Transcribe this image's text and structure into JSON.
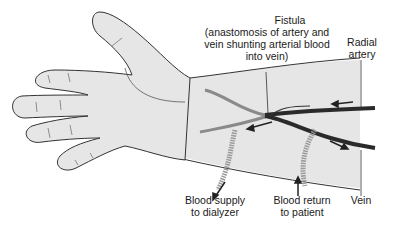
{
  "diagram": {
    "labels": {
      "fistula_title": "Fistula",
      "fistula_l1": "(anastomosis of artery and",
      "fistula_l2": "vein shunting arterial blood",
      "fistula_l3": "into vein)",
      "radial_l1": "Radial",
      "radial_l2": "artery",
      "supply_l1": "Blood supply",
      "supply_l2": "to dialyzer",
      "return_l1": "Blood return",
      "return_l2": "to patient",
      "vein": "Vein"
    },
    "colors": {
      "skin_fill": "#e6e6e6",
      "outline": "#333333",
      "vessel": "#2a2a2a",
      "vessel_light": "#8a8a8a",
      "tube": "#9a9a9a",
      "text": "#1a1a1a"
    }
  }
}
